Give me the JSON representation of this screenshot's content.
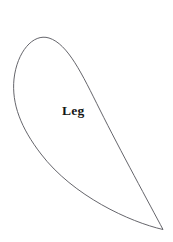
{
  "canvas": {
    "width": 173,
    "height": 242,
    "background_color": "#ffffff"
  },
  "diagram": {
    "title": "Leg",
    "shape_name": "leg-teardrop-outline",
    "label": {
      "text": "Leg",
      "x": 62,
      "y": 104,
      "font_size": 13.5,
      "font_weight": "bold",
      "color": "#151515"
    },
    "outline": {
      "stroke_color": "#54545a",
      "stroke_width": 0.9,
      "fill": "none",
      "description": "Closed teardrop / leaf outline: rounded bulge at upper left, tapering to a sharp point at lower right",
      "path": "M 163.0 229.5 C 150.0 205.0 120.0 150.0 100.0 110.0 C 82.0 74.0 68.0 44.0 49.0 38.0 C 33.0 33.0 17.0 52.0 14.0 79.0 C 11.5 104.0 21.0 128.0 41.0 154.0 C 73.0 196.0 130.0 222.0 163.0 229.5 Z",
      "key_points": {
        "apex_point": [
          163,
          229.5
        ],
        "top_of_bulge": [
          57,
          37.5
        ],
        "leftmost": [
          14,
          80
        ],
        "right_curve_mid": [
          131,
          150
        ]
      }
    }
  }
}
